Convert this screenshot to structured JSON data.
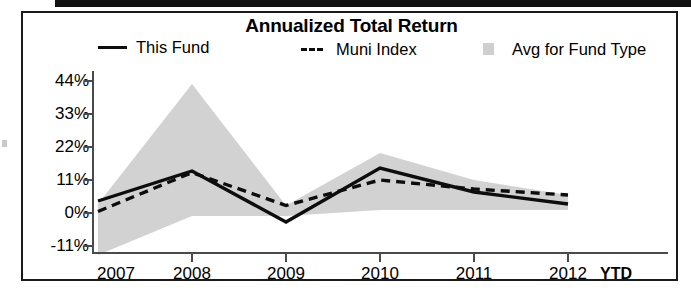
{
  "chart_data": {
    "type": "line",
    "title": "Annualized Total Return",
    "xlabel": "",
    "ylabel": "",
    "grid": false,
    "legend_position": "top",
    "categories": [
      "2007",
      "2008",
      "2009",
      "2010",
      "2011",
      "2012"
    ],
    "x_tick_labels": [
      "2007",
      "2008",
      "2009",
      "2010",
      "2011",
      "2012"
    ],
    "x_axis_note": "YTD",
    "y_tick_labels": [
      "44%",
      "33%",
      "22%",
      "11%",
      "0%",
      "-11%"
    ],
    "y_tick_values": [
      44,
      33,
      22,
      11,
      0,
      -11
    ],
    "ylim": [
      -14,
      46
    ],
    "series": [
      {
        "name": "This Fund",
        "style": "solid",
        "color": "#0d0d0d",
        "values": [
          4,
          14,
          -3,
          15,
          7,
          3
        ]
      },
      {
        "name": "Muni Index",
        "style": "dashed",
        "color": "#0d0d0d",
        "values": [
          0.5,
          13.5,
          2.5,
          11,
          8,
          6
        ]
      },
      {
        "name": "Avg for Fund Type",
        "style": "area-band",
        "color": "#d2d2d2",
        "upper": [
          3,
          43,
          2.5,
          20,
          11,
          6
        ],
        "lower": [
          -14,
          -1,
          -1,
          1,
          1,
          1
        ]
      }
    ]
  },
  "legend": {
    "items": [
      {
        "label": "This Fund",
        "swatch": "solid-line-swatch"
      },
      {
        "label": "Muni Index",
        "swatch": "dashed-line-swatch"
      },
      {
        "label": "Avg for Fund Type",
        "swatch": "area-fill-swatch"
      }
    ]
  }
}
